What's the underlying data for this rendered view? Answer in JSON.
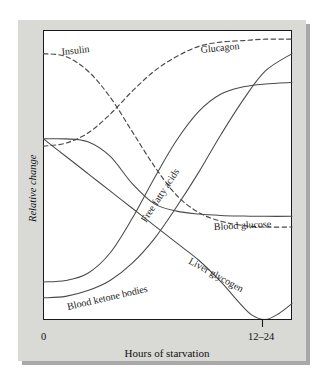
{
  "figure": {
    "background_color": "#ffffff",
    "mat_color": "#d9d9d6",
    "shadow_color": "#a8a8a8",
    "canvas_color": "#ffffff",
    "frame_color": "#1a1a1a",
    "curve_color": "#4a4a4a"
  },
  "chart_data": {
    "type": "line",
    "title": "",
    "subtitle": "",
    "xlabel": "Hours of starvation",
    "ylabel": "Relative change",
    "xticks": [
      "0",
      "12–24"
    ],
    "yticks": [],
    "xlim": [
      0,
      1.12
    ],
    "ylim": [
      0,
      1
    ],
    "grid": false,
    "legend": "inline-curve-labels",
    "annotations": [
      "Insulin",
      "Glucagon",
      "Free fatty acids",
      "Blood glucose",
      "Liver glycogen",
      "Blood ketone bodies"
    ],
    "series": [
      {
        "name": "Insulin",
        "style": "dashed",
        "label": "Insulin",
        "x": [
          0.0,
          0.1,
          0.2,
          0.3,
          0.4,
          0.5,
          0.6,
          0.7,
          0.8,
          0.9,
          1.0,
          1.12
        ],
        "values": [
          0.92,
          0.91,
          0.86,
          0.77,
          0.65,
          0.53,
          0.43,
          0.37,
          0.34,
          0.325,
          0.32,
          0.32
        ]
      },
      {
        "name": "Glucagon",
        "style": "dashed",
        "label": "Glucagon",
        "x": [
          0.0,
          0.1,
          0.2,
          0.3,
          0.4,
          0.5,
          0.6,
          0.7,
          0.8,
          0.9,
          1.0,
          1.12
        ],
        "values": [
          0.6,
          0.61,
          0.645,
          0.71,
          0.79,
          0.86,
          0.91,
          0.945,
          0.96,
          0.965,
          0.97,
          0.97
        ]
      },
      {
        "name": "Free fatty acids",
        "style": "solid",
        "label": "Free fatty acids",
        "x": [
          0.0,
          0.1,
          0.2,
          0.3,
          0.4,
          0.5,
          0.6,
          0.7,
          0.8,
          0.9,
          1.0,
          1.12
        ],
        "values": [
          0.13,
          0.135,
          0.16,
          0.23,
          0.35,
          0.49,
          0.62,
          0.72,
          0.78,
          0.805,
          0.815,
          0.82
        ]
      },
      {
        "name": "Blood glucose",
        "style": "solid",
        "label": "Blood glucose",
        "x": [
          0.0,
          0.1,
          0.2,
          0.3,
          0.4,
          0.5,
          0.6,
          0.7,
          0.8,
          0.9,
          1.0,
          1.12
        ],
        "values": [
          0.625,
          0.625,
          0.615,
          0.565,
          0.47,
          0.4,
          0.375,
          0.365,
          0.36,
          0.358,
          0.357,
          0.357
        ]
      },
      {
        "name": "Liver glycogen",
        "style": "solid",
        "label": "Liver glycogen",
        "x": [
          0.0,
          0.1,
          0.2,
          0.3,
          0.4,
          0.5,
          0.6,
          0.7,
          0.8,
          0.88,
          0.94,
          1.0,
          1.06,
          1.12
        ],
        "values": [
          0.625,
          0.565,
          0.505,
          0.445,
          0.385,
          0.325,
          0.265,
          0.205,
          0.13,
          0.06,
          0.015,
          0.0,
          0.02,
          0.055
        ]
      },
      {
        "name": "Blood ketone bodies",
        "style": "solid",
        "label": "Blood ketone bodies",
        "x": [
          0.0,
          0.1,
          0.2,
          0.3,
          0.4,
          0.5,
          0.6,
          0.7,
          0.8,
          0.9,
          1.0,
          1.12
        ],
        "values": [
          0.075,
          0.08,
          0.1,
          0.135,
          0.195,
          0.28,
          0.39,
          0.51,
          0.64,
          0.76,
          0.86,
          0.92
        ]
      }
    ]
  },
  "labels": {
    "insulin": "Insulin",
    "glucagon": "Glucagon",
    "free_fatty_acids": "Free fatty acids",
    "blood_glucose": "Blood glucose",
    "liver_glycogen": "Liver glycogen",
    "blood_ketone_bodies": "Blood ketone bodies"
  },
  "axes": {
    "y_title": "Relative change",
    "x_title": "Hours of starvation",
    "x_tick_left": "0",
    "x_tick_right": "12–24"
  }
}
